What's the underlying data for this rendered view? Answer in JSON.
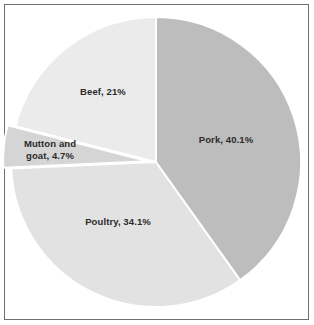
{
  "figure": {
    "background_color": "#ffffff",
    "border_color": "#6e6e6e",
    "label_text_color": "#2b2b2b"
  },
  "chart_data": {
    "type": "pie",
    "title": "",
    "subtitle": "",
    "xlabel": "",
    "ylabel": "",
    "legend_position": "none",
    "grid": false,
    "labels_inside_slices": true,
    "start_angle_deg": 0,
    "direction": "clockwise",
    "categories": [
      "Pork",
      "Poultry",
      "Mutton and goat",
      "Beef"
    ],
    "values": [
      40.1,
      34.1,
      4.7,
      21.0
    ],
    "value_unit": "%",
    "slices": [
      {
        "name": "Pork",
        "value": 40.1,
        "label": "Pork, 40.1%",
        "color": "#bdbdbd",
        "start_angle_deg": 0,
        "end_angle_deg": 144.36,
        "exploded": false
      },
      {
        "name": "Poultry",
        "value": 34.1,
        "label": "Poultry, 34.1%",
        "color": "#e2e2e2",
        "start_angle_deg": 144.36,
        "end_angle_deg": 267.12,
        "exploded": false
      },
      {
        "name": "Mutton and goat",
        "value": 4.7,
        "label_line_1": "Mutton and",
        "label_line_2": "goat, 4.7%",
        "label": "Mutton and goat, 4.7%",
        "color": "#d5d5d5",
        "start_angle_deg": 267.12,
        "end_angle_deg": 284.04,
        "exploded": true
      },
      {
        "name": "Beef",
        "value": 21.0,
        "label": "Beef, 21%",
        "color": "#ebebeb",
        "start_angle_deg": 284.04,
        "end_angle_deg": 360,
        "exploded": false
      }
    ]
  }
}
